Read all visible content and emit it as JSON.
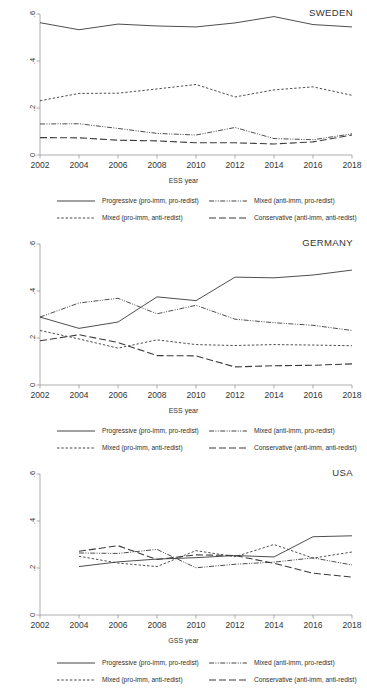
{
  "figure": {
    "axis_color": "#8a8a8a",
    "line_color": "#3a3a3a"
  },
  "legend": {
    "entries": [
      {
        "label": "Progressive (pro-imm, pro-redist)",
        "style": "solid",
        "key": "progressive"
      },
      {
        "label": "Mixed (anti-imm, pro-redist)",
        "style": "dash-dot-dot",
        "key": "mixed_anti_pro"
      },
      {
        "label": "Mixed (pro-imm, anti-redist)",
        "style": "dotted",
        "key": "mixed_pro_anti"
      },
      {
        "label": "Conservative (anti-imm, anti-redist)",
        "style": "long-dash",
        "key": "conservative"
      }
    ]
  },
  "panels": [
    {
      "title": "SWEDEN",
      "xlabel": "ESS year"
    },
    {
      "title": "GERMANY",
      "xlabel": "ESS year"
    },
    {
      "title": "USA",
      "xlabel": "GSS year"
    }
  ],
  "chart_data": [
    {
      "type": "line",
      "title": "SWEDEN",
      "xlabel": "ESS year",
      "ylabel": "",
      "xlim": [
        2002,
        2018
      ],
      "ylim": [
        0,
        0.6
      ],
      "xticks": [
        2002,
        2004,
        2006,
        2008,
        2010,
        2012,
        2014,
        2016,
        2018
      ],
      "yticks": [
        0,
        0.2,
        0.4,
        0.6
      ],
      "ytick_labels": [
        "0",
        ".2",
        ".4",
        ".6"
      ],
      "grid": false,
      "legend_position": "below",
      "x": [
        2002,
        2004,
        2006,
        2008,
        2010,
        2012,
        2014,
        2016,
        2018
      ],
      "series": [
        {
          "name": "Progressive (pro-imm, pro-redist)",
          "style": "solid",
          "values": [
            0.563,
            0.533,
            0.557,
            0.549,
            0.545,
            0.562,
            0.589,
            0.555,
            0.545
          ]
        },
        {
          "name": "Mixed (pro-imm, anti-redist)",
          "style": "dotted",
          "values": [
            0.231,
            0.262,
            0.263,
            0.281,
            0.3,
            0.247,
            0.277,
            0.29,
            0.254
          ]
        },
        {
          "name": "Mixed (anti-imm, pro-redist)",
          "style": "dash-dot-dot",
          "values": [
            0.132,
            0.133,
            0.113,
            0.092,
            0.085,
            0.117,
            0.07,
            0.065,
            0.09
          ]
        },
        {
          "name": "Conservative (anti-imm, anti-redist)",
          "style": "long-dash",
          "values": [
            0.074,
            0.073,
            0.063,
            0.06,
            0.052,
            0.052,
            0.047,
            0.056,
            0.085
          ]
        }
      ]
    },
    {
      "type": "line",
      "title": "GERMANY",
      "xlabel": "ESS year",
      "ylabel": "",
      "xlim": [
        2002,
        2018
      ],
      "ylim": [
        0,
        0.6
      ],
      "xticks": [
        2002,
        2004,
        2006,
        2008,
        2010,
        2012,
        2014,
        2016,
        2018
      ],
      "yticks": [
        0,
        0.2,
        0.4,
        0.6
      ],
      "ytick_labels": [
        "0",
        ".2",
        ".4",
        ".6"
      ],
      "grid": false,
      "legend_position": "below",
      "x": [
        2002,
        2004,
        2006,
        2008,
        2010,
        2012,
        2014,
        2016,
        2018
      ],
      "series": [
        {
          "name": "Progressive (pro-imm, pro-redist)",
          "style": "solid",
          "values": [
            0.289,
            0.241,
            0.268,
            0.375,
            0.359,
            0.459,
            0.456,
            0.468,
            0.489
          ]
        },
        {
          "name": "Mixed (anti-imm, pro-redist)",
          "style": "dash-dot-dot",
          "values": [
            0.289,
            0.349,
            0.369,
            0.303,
            0.339,
            0.28,
            0.265,
            0.254,
            0.232
          ]
        },
        {
          "name": "Mixed (pro-imm, anti-redist)",
          "style": "dotted",
          "values": [
            0.232,
            0.196,
            0.157,
            0.192,
            0.172,
            0.168,
            0.172,
            0.17,
            0.167
          ]
        },
        {
          "name": "Conservative (anti-imm, anti-redist)",
          "style": "long-dash",
          "values": [
            0.188,
            0.214,
            0.181,
            0.125,
            0.124,
            0.077,
            0.082,
            0.084,
            0.09
          ]
        }
      ]
    },
    {
      "type": "line",
      "title": "USA",
      "xlabel": "GSS year",
      "ylabel": "",
      "xlim": [
        2002,
        2018
      ],
      "ylim": [
        0,
        0.6
      ],
      "xticks": [
        2002,
        2004,
        2006,
        2008,
        2010,
        2012,
        2014,
        2016,
        2018
      ],
      "yticks": [
        0,
        0.2,
        0.4,
        0.6
      ],
      "ytick_labels": [
        "0",
        ".2",
        ".4",
        ".6"
      ],
      "grid": false,
      "legend_position": "below",
      "x": [
        2004,
        2006,
        2008,
        2010,
        2012,
        2014,
        2016,
        2018
      ],
      "series": [
        {
          "name": "Progressive (pro-imm, pro-redist)",
          "style": "solid",
          "values": [
            0.206,
            0.226,
            0.238,
            0.244,
            0.253,
            0.247,
            0.333,
            0.337
          ]
        },
        {
          "name": "Mixed (pro-imm, anti-redist)",
          "style": "dotted",
          "values": [
            0.25,
            0.221,
            0.206,
            0.274,
            0.248,
            0.3,
            0.242,
            0.268
          ]
        },
        {
          "name": "Mixed (anti-imm, pro-redist)",
          "style": "dash-dot-dot",
          "values": [
            0.264,
            0.262,
            0.279,
            0.201,
            0.216,
            0.225,
            0.243,
            0.213
          ]
        },
        {
          "name": "Conservative (anti-imm, anti-redist)",
          "style": "long-dash",
          "values": [
            0.271,
            0.295,
            0.236,
            0.256,
            0.253,
            0.22,
            0.178,
            0.161
          ]
        }
      ]
    }
  ]
}
